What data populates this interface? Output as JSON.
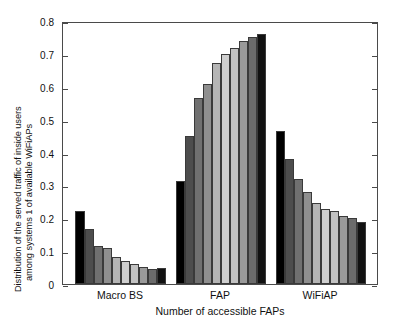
{
  "chart_data": {
    "type": "bar",
    "title": "",
    "xlabel": "Number of accessible FAPs",
    "ylabel_line1": "Distribution of the served traffic of inside users",
    "ylabel_line2": "among systems 1 of available  WiFiAPs",
    "categories": [
      "Macro BS",
      "FAP",
      "WiFiAP"
    ],
    "series_index_labels": [
      "1",
      "2",
      "3",
      "4",
      "5",
      "6",
      "7",
      "8",
      "9",
      "10"
    ],
    "ylim": [
      0,
      0.8
    ],
    "yticks": [
      0,
      0.1,
      0.2,
      0.3,
      0.4,
      0.5,
      0.6,
      0.7,
      0.8
    ],
    "ytick_labels": [
      "0",
      "0.1",
      "0.2",
      "0.3",
      "0.4",
      "0.5",
      "0.6",
      "0.7",
      "0.8"
    ],
    "grid": false,
    "legend": "none",
    "bar_colors": [
      "#000000",
      "#4d4d4d",
      "#707070",
      "#8f8f8f",
      "#b5b5b5",
      "#cfcfcf",
      "#c2c2c2",
      "#9a9a9a",
      "#6b6b6b",
      "#111111"
    ],
    "groups": [
      {
        "name": "Macro BS",
        "values": [
          0.223,
          0.168,
          0.115,
          0.111,
          0.082,
          0.07,
          0.062,
          0.052,
          0.046,
          0.048
        ]
      },
      {
        "name": "FAP",
        "values": [
          0.312,
          0.451,
          0.566,
          0.608,
          0.673,
          0.7,
          0.717,
          0.74,
          0.752,
          0.76
        ]
      },
      {
        "name": "WiFiAP",
        "values": [
          0.464,
          0.381,
          0.32,
          0.281,
          0.245,
          0.227,
          0.221,
          0.207,
          0.2,
          0.19
        ]
      }
    ]
  }
}
